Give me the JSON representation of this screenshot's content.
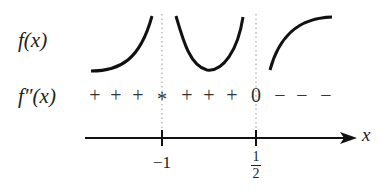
{
  "labels": {
    "f": "f(x)",
    "fpp": "f″(x)",
    "axis_var": "x"
  },
  "signs": [
    {
      "s": "+",
      "x": 95
    },
    {
      "s": "+",
      "x": 116
    },
    {
      "s": "+",
      "x": 138
    },
    {
      "s": "*",
      "x": 162
    },
    {
      "s": "+",
      "x": 187
    },
    {
      "s": "+",
      "x": 209
    },
    {
      "s": "+",
      "x": 232
    },
    {
      "s": "0",
      "x": 256
    },
    {
      "s": "−",
      "x": 280
    },
    {
      "s": "−",
      "x": 302
    },
    {
      "s": "−",
      "x": 326
    }
  ],
  "ticks": [
    {
      "label": "−1",
      "x": 162
    },
    {
      "num": "1",
      "den": "2",
      "x": 256
    }
  ],
  "colors": {
    "ink": "#111111",
    "dotted": "#999999"
  }
}
